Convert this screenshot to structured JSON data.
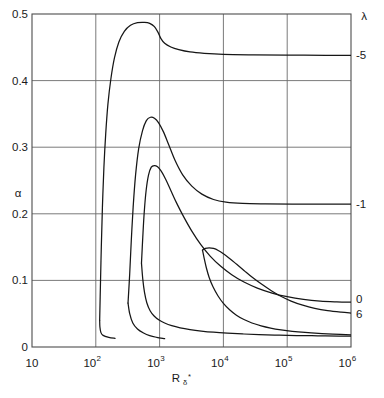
{
  "chart_data": {
    "type": "line",
    "title": "",
    "xlabel": "Rδ*",
    "xlabel_base": "R",
    "xlabel_sub": "δ",
    "xlabel_sup": "*",
    "ylabel": "α",
    "xscale": "log",
    "yscale": "linear",
    "xlim": [
      10,
      1000000
    ],
    "ylim": [
      0,
      0.5
    ],
    "grid": true,
    "legend_position": "right-edge-curve-labels",
    "legend_title": "λ",
    "xticks": [
      {
        "value": 10,
        "base": "10",
        "exp": ""
      },
      {
        "value": 100,
        "base": "10",
        "exp": "2"
      },
      {
        "value": 1000,
        "base": "10",
        "exp": "3"
      },
      {
        "value": 10000,
        "base": "10",
        "exp": "4"
      },
      {
        "value": 100000,
        "base": "10",
        "exp": "5"
      },
      {
        "value": 1000000,
        "base": "10",
        "exp": "6"
      }
    ],
    "yticks": [
      {
        "value": 0,
        "label": "0"
      },
      {
        "value": 0.1,
        "label": "0.1"
      },
      {
        "value": 0.2,
        "label": "0.2"
      },
      {
        "value": 0.3,
        "label": "0.3"
      },
      {
        "value": 0.4,
        "label": "0.4"
      },
      {
        "value": 0.5,
        "label": "0.5"
      }
    ],
    "curve_labels": [
      {
        "label": "-5",
        "y": 0.438
      },
      {
        "label": "-1",
        "y": 0.215
      },
      {
        "label": "0",
        "y": 0.072
      },
      {
        "label": "6",
        "y": 0.05
      }
    ],
    "series": [
      {
        "name": "-5",
        "lambda": -5,
        "branch": "upper",
        "points": [
          [
            115,
            0.04
          ],
          [
            118,
            0.09
          ],
          [
            122,
            0.15
          ],
          [
            127,
            0.21
          ],
          [
            134,
            0.27
          ],
          [
            143,
            0.32
          ],
          [
            155,
            0.365
          ],
          [
            172,
            0.402
          ],
          [
            196,
            0.434
          ],
          [
            230,
            0.458
          ],
          [
            280,
            0.474
          ],
          [
            350,
            0.483
          ],
          [
            450,
            0.487
          ],
          [
            580,
            0.4875
          ],
          [
            700,
            0.486
          ],
          [
            830,
            0.481
          ],
          [
            950,
            0.472
          ],
          [
            1050,
            0.463
          ],
          [
            1200,
            0.456
          ],
          [
            1500,
            0.4505
          ],
          [
            2000,
            0.4465
          ],
          [
            3000,
            0.443
          ],
          [
            5000,
            0.441
          ],
          [
            10000,
            0.4395
          ],
          [
            30000,
            0.4387
          ],
          [
            100000,
            0.4382
          ],
          [
            400000,
            0.438
          ],
          [
            1000000,
            0.438
          ]
        ]
      },
      {
        "name": "-5-lower",
        "lambda": -5,
        "branch": "lower",
        "points": [
          [
            115,
            0.04
          ],
          [
            116,
            0.03
          ],
          [
            120,
            0.022
          ],
          [
            130,
            0.0175
          ],
          [
            160,
            0.0145
          ],
          [
            200,
            0.013
          ]
        ]
      },
      {
        "name": "-1",
        "lambda": -1,
        "branch": "upper",
        "points": [
          [
            320,
            0.066
          ],
          [
            340,
            0.11
          ],
          [
            360,
            0.16
          ],
          [
            385,
            0.21
          ],
          [
            420,
            0.258
          ],
          [
            470,
            0.298
          ],
          [
            540,
            0.325
          ],
          [
            620,
            0.34
          ],
          [
            720,
            0.345
          ],
          [
            830,
            0.3435
          ],
          [
            960,
            0.337
          ],
          [
            1150,
            0.323
          ],
          [
            1400,
            0.303
          ],
          [
            1750,
            0.28
          ],
          [
            2300,
            0.2585
          ],
          [
            3200,
            0.2415
          ],
          [
            4600,
            0.2295
          ],
          [
            7000,
            0.2215
          ],
          [
            11000,
            0.2175
          ],
          [
            20000,
            0.2155
          ],
          [
            45000,
            0.2148
          ],
          [
            120000,
            0.2145
          ],
          [
            400000,
            0.2145
          ],
          [
            1000000,
            0.2145
          ]
        ]
      },
      {
        "name": "-1-lower",
        "lambda": -1,
        "branch": "lower",
        "points": [
          [
            320,
            0.066
          ],
          [
            340,
            0.05
          ],
          [
            380,
            0.036
          ],
          [
            450,
            0.027
          ],
          [
            560,
            0.021
          ],
          [
            700,
            0.017
          ],
          [
            900,
            0.0145
          ],
          [
            1200,
            0.0125
          ]
        ]
      },
      {
        "name": "0",
        "lambda": 0,
        "branch": "upper",
        "points": [
          [
            520,
            0.126
          ],
          [
            545,
            0.165
          ],
          [
            575,
            0.203
          ],
          [
            615,
            0.235
          ],
          [
            670,
            0.258
          ],
          [
            740,
            0.27
          ],
          [
            830,
            0.2725
          ],
          [
            930,
            0.2705
          ],
          [
            1060,
            0.264
          ],
          [
            1250,
            0.2515
          ],
          [
            1500,
            0.235
          ],
          [
            1850,
            0.216
          ],
          [
            2400,
            0.195
          ],
          [
            3200,
            0.174
          ],
          [
            4400,
            0.154
          ],
          [
            6200,
            0.1365
          ],
          [
            9000,
            0.1215
          ],
          [
            13500,
            0.1085
          ],
          [
            21000,
            0.0975
          ],
          [
            34000,
            0.0885
          ],
          [
            58000,
            0.081
          ],
          [
            100000,
            0.0755
          ],
          [
            180000,
            0.0715
          ],
          [
            330000,
            0.069
          ],
          [
            600000,
            0.0678
          ],
          [
            1000000,
            0.0672
          ]
        ]
      },
      {
        "name": "0-lower",
        "lambda": 0,
        "branch": "lower",
        "points": [
          [
            520,
            0.126
          ],
          [
            545,
            0.102
          ],
          [
            580,
            0.082
          ],
          [
            630,
            0.0665
          ],
          [
            710,
            0.0545
          ],
          [
            820,
            0.0465
          ],
          [
            980,
            0.0405
          ],
          [
            1200,
            0.036
          ],
          [
            1550,
            0.032
          ],
          [
            2100,
            0.0288
          ],
          [
            3000,
            0.0262
          ],
          [
            4500,
            0.024
          ],
          [
            7000,
            0.0222
          ],
          [
            11500,
            0.0208
          ],
          [
            20000,
            0.0196
          ],
          [
            36000,
            0.0186
          ],
          [
            70000,
            0.0178
          ],
          [
            140000,
            0.0172
          ],
          [
            300000,
            0.0168
          ],
          [
            650000,
            0.0165
          ],
          [
            1000000,
            0.0164
          ]
        ]
      },
      {
        "name": "6",
        "lambda": 6,
        "branch": "upper",
        "points": [
          [
            4700,
            0.1455
          ],
          [
            5200,
            0.148
          ],
          [
            6000,
            0.149
          ],
          [
            7000,
            0.148
          ],
          [
            8300,
            0.145
          ],
          [
            10000,
            0.14
          ],
          [
            12500,
            0.133
          ],
          [
            16000,
            0.1245
          ],
          [
            21000,
            0.115
          ],
          [
            28000,
            0.105
          ],
          [
            39000,
            0.0948
          ],
          [
            55000,
            0.0852
          ],
          [
            78000,
            0.0765
          ],
          [
            115000,
            0.069
          ],
          [
            175000,
            0.0628
          ],
          [
            270000,
            0.058
          ],
          [
            430000,
            0.0545
          ],
          [
            700000,
            0.0522
          ],
          [
            1000000,
            0.051
          ]
        ]
      },
      {
        "name": "6-lower",
        "lambda": 6,
        "branch": "lower",
        "points": [
          [
            4700,
            0.1455
          ],
          [
            5000,
            0.133
          ],
          [
            5400,
            0.119
          ],
          [
            6000,
            0.104
          ],
          [
            6900,
            0.09
          ],
          [
            8200,
            0.077
          ],
          [
            10000,
            0.0655
          ],
          [
            12500,
            0.056
          ],
          [
            16000,
            0.0478
          ],
          [
            21000,
            0.0412
          ],
          [
            28000,
            0.036
          ],
          [
            39000,
            0.0318
          ],
          [
            55000,
            0.0285
          ],
          [
            80000,
            0.0258
          ],
          [
            120000,
            0.0236
          ],
          [
            190000,
            0.0218
          ],
          [
            310000,
            0.0204
          ],
          [
            520000,
            0.0193
          ],
          [
            1000000,
            0.0183
          ]
        ]
      }
    ]
  }
}
